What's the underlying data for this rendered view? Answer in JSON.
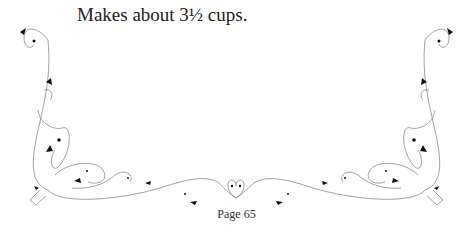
{
  "content": {
    "yield_text": "Makes about 3½ cups.",
    "page_label": "Page 65"
  },
  "decoration": {
    "type": "flourish-border",
    "line_color": "#8a8a8a",
    "leaf_color": "#111111"
  }
}
